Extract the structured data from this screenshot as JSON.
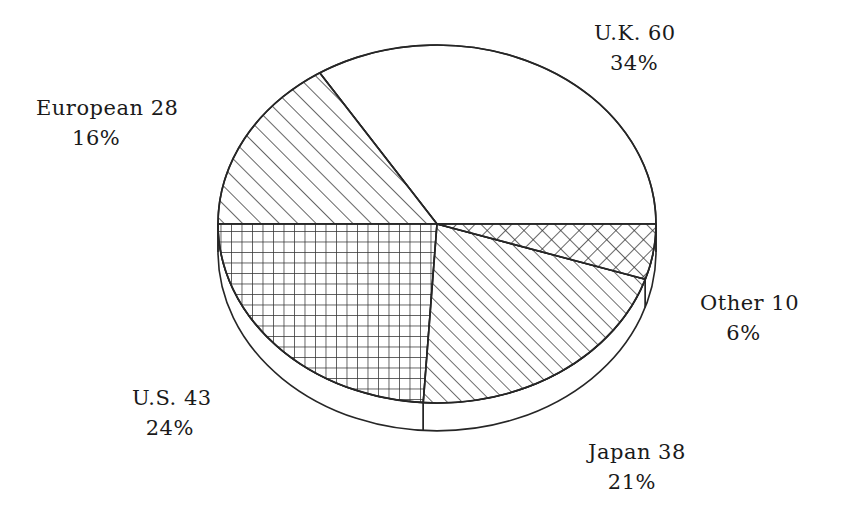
{
  "chart_data": {
    "type": "pie",
    "title": "",
    "subtitle": "",
    "xlabel": "",
    "ylabel": "",
    "grid": false,
    "legend": "none",
    "style": "3d-exploded-hatched-monochrome",
    "total": 179,
    "categories": [
      "U.K.",
      "European",
      "U.S.",
      "Japan",
      "Other"
    ],
    "values": [
      60,
      28,
      43,
      38,
      10
    ],
    "percents": [
      34,
      16,
      24,
      21,
      6
    ],
    "slices": [
      {
        "name": "U.K.",
        "label_name": "U.K.",
        "value": 60,
        "percent": 34,
        "value_text": "U.K. 60",
        "percent_text": "34%",
        "pattern": "solid-white",
        "start_angle_deg": 0,
        "end_angle_deg": 122.4
      },
      {
        "name": "European",
        "label_name": "European",
        "value": 28,
        "percent": 16,
        "value_text": "European 28",
        "percent_text": "16%",
        "pattern": "diagonal-lines",
        "start_angle_deg": 122.4,
        "end_angle_deg": 180.0
      },
      {
        "name": "U.S.",
        "label_name": "U.S.",
        "value": 43,
        "percent": 24,
        "value_text": "U.S. 43",
        "percent_text": "24%",
        "pattern": "square-grid",
        "start_angle_deg": 180.0,
        "end_angle_deg": 266.4
      },
      {
        "name": "Japan",
        "label_name": "Japan",
        "value": 38,
        "percent": 21,
        "value_text": "Japan 38",
        "percent_text": "21%",
        "pattern": "diagonal-lines-dense",
        "start_angle_deg": 266.4,
        "end_angle_deg": 342.0
      },
      {
        "name": "Other",
        "label_name": "Other",
        "value": 10,
        "percent": 6,
        "value_text": "Other 10",
        "percent_text": "6%",
        "pattern": "diagonal-crosshatch",
        "start_angle_deg": 342.0,
        "end_angle_deg": 360.0
      }
    ],
    "colors": {
      "stroke": "#262626",
      "fill": "#ffffff",
      "background": "#ffffff",
      "text": "#1a1a1a"
    }
  }
}
